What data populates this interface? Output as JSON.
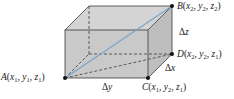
{
  "diagram": {
    "type": "3d-rectangular-box",
    "colors": {
      "face_fill": "#c8c8c8",
      "top_fill": "#d2d2d2",
      "side_fill": "#bdbdbd",
      "edge": "#3a3a3a",
      "diagonal": "#7aa3cc",
      "point": "#111111"
    },
    "points": {
      "A": {
        "name": "A",
        "coords": "(x1, y1, z1)",
        "x": 65,
        "y": 78
      },
      "B": {
        "name": "B",
        "coords": "(x2, y2, z2)",
        "x": 172,
        "y": 6
      },
      "C": {
        "name": "C",
        "coords": "(x1, y2, z1)",
        "x": 148,
        "y": 78
      },
      "D": {
        "name": "D",
        "coords": "(x2, y2, z1)",
        "x": 172,
        "y": 54
      }
    },
    "labels": {
      "A": {
        "letter": "A",
        "x": "x",
        "xs": "1",
        "y": "y",
        "ys": "1",
        "z": "z",
        "zs": "1"
      },
      "B": {
        "letter": "B",
        "x": "x",
        "xs": "2",
        "y": "y",
        "ys": "2",
        "z": "z",
        "zs": "2"
      },
      "C": {
        "letter": "C",
        "x": "x",
        "xs": "1",
        "y": "y",
        "ys": "2",
        "z": "z",
        "zs": "1"
      },
      "D": {
        "letter": "D",
        "x": "x",
        "xs": "2",
        "y": "y",
        "ys": "2",
        "z": "z",
        "zs": "1"
      }
    },
    "deltas": {
      "dx": {
        "symbol": "Δ",
        "var": "x"
      },
      "dy": {
        "symbol": "Δ",
        "var": "y"
      },
      "dz": {
        "symbol": "Δ",
        "var": "z"
      }
    },
    "punct": {
      "open": "(",
      "close": ")",
      "comma": ", "
    }
  }
}
